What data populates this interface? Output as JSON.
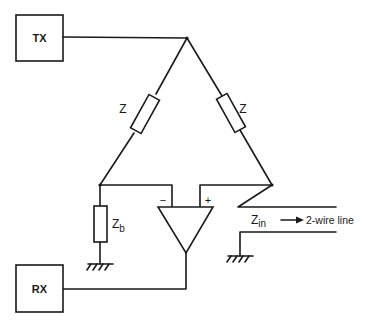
{
  "diagram": {
    "title": "",
    "blocks": {
      "tx": {
        "label": "TX"
      },
      "rx": {
        "label": "RX"
      }
    },
    "impedances": {
      "z_left": {
        "label": "Z"
      },
      "z_right": {
        "label": "Z"
      },
      "z_b": {
        "label": "Z",
        "subscript": "b"
      },
      "z_in": {
        "label": "Z",
        "subscript": "in"
      }
    },
    "amplifier": {
      "minus": "−",
      "plus": "+"
    },
    "line": {
      "label": "2-wire line"
    },
    "colors": {
      "stroke": "#1a1a1a",
      "background": "#ffffff"
    }
  }
}
